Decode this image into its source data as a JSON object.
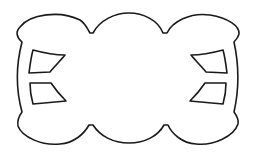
{
  "figure": {
    "description": "Line drawing of a scalloped cloud-like frame with four window-shaped cutouts",
    "colors": {
      "background": "#ffffff",
      "stroke": "#1a1a1a"
    },
    "shapes": {
      "outer_frame": "scalloped-frame",
      "cutouts": [
        {
          "name": "cutout-upper-left"
        },
        {
          "name": "cutout-lower-left"
        },
        {
          "name": "cutout-upper-right"
        },
        {
          "name": "cutout-lower-right"
        }
      ]
    }
  }
}
